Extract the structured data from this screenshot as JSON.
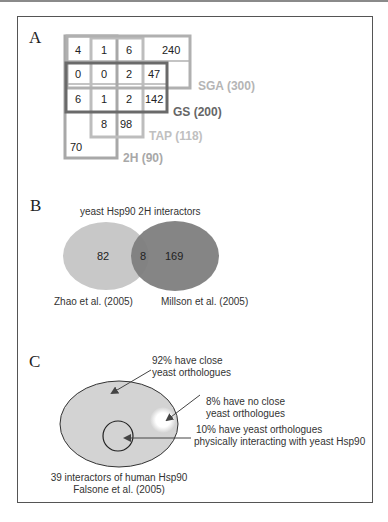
{
  "panels": {
    "a": {
      "label": "A",
      "cells": {
        "r1": [
          "4",
          "1",
          "6",
          "240"
        ],
        "r2": [
          "0",
          "0",
          "2",
          "47"
        ],
        "r3": [
          "6",
          "1",
          "2",
          "142"
        ],
        "r4": [
          "8",
          "98"
        ],
        "r5": [
          "70"
        ]
      },
      "sets": {
        "sga": "SGA (300)",
        "gs": "GS (200)",
        "tap": "TAP (118)",
        "h2": "2H (90)"
      },
      "colors": {
        "sga": "#b0b0b0",
        "gs": "#6a6a6a",
        "tap": "#bdbdbd",
        "h2": "#a8a8a8"
      }
    },
    "b": {
      "label": "B",
      "title": "yeast Hsp90 2H interactors",
      "left_only": "82",
      "overlap": "8",
      "right_only": "169",
      "left_source": "Zhao et al. (2005)",
      "right_source": "Millson et al. (2005)",
      "colors": {
        "left": "#c8c8c8",
        "right": "#7e7e7e"
      }
    },
    "c": {
      "label": "C",
      "ann_close_1": "92% have close",
      "ann_close_2": "yeast orthologues",
      "ann_noclose_1": "8% have no close",
      "ann_noclose_2": "yeast orthologues",
      "ann_phys_1": "10%  have yeast orthologues",
      "ann_phys_2": "physically interacting with yeast Hsp90",
      "caption_1": "39 interactors of human Hsp90",
      "caption_2": "Falsone et al. (2005)",
      "colors": {
        "ellipse": "#d3d3d3"
      }
    }
  }
}
